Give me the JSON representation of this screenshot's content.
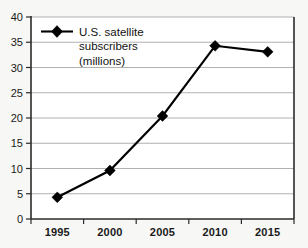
{
  "chart_data": {
    "type": "line",
    "title": "",
    "xlabel": "",
    "ylabel": "",
    "categories": [
      "1995",
      "2000",
      "2005",
      "2010",
      "2015"
    ],
    "series": [
      {
        "name": "U.S. satellite subscribers (millions)",
        "values": [
          4.3,
          9.6,
          20.4,
          34.3,
          33.1
        ],
        "marker": "diamond",
        "color": "#000000"
      }
    ],
    "ylim": [
      0,
      40
    ],
    "ytick_values": [
      0,
      5,
      10,
      15,
      20,
      25,
      30,
      35,
      40
    ],
    "ytick_labels": [
      "0",
      "5",
      "10",
      "15",
      "20",
      "25",
      "30",
      "35",
      "40"
    ],
    "xtick_labels": [
      "1995",
      "2000",
      "2005",
      "2010",
      "2015"
    ],
    "grid": true,
    "grid_axis": "y",
    "legend": {
      "position": "inside-top-left",
      "entries": [
        {
          "marker": "diamond",
          "lines": [
            "U.S. satellite",
            "subscribers",
            "(millions)"
          ]
        }
      ]
    },
    "colors": {
      "background": "#f7f7f5",
      "gridline": "#a8a8a8",
      "axis": "#2b2b2b",
      "series": "#000000",
      "text": "#1a1a1a"
    }
  }
}
